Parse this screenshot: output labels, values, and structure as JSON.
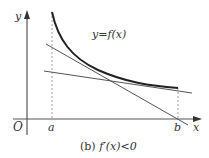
{
  "figure": {
    "axis_labels": {
      "y": "y",
      "x": "x",
      "origin": "O"
    },
    "points": {
      "a": "a",
      "b": "b"
    },
    "curve_label": "y=f(x)",
    "caption_prefix": "(b) ",
    "caption_math": "f′(x)<0"
  },
  "colors": {
    "axis": "#555555",
    "curve": "#222222",
    "line": "#555555",
    "dashed": "#888888"
  }
}
